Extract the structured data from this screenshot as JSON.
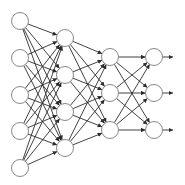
{
  "diagram": {
    "type": "neural-network",
    "title": "",
    "colors": {
      "background": "#ffffff",
      "edge": "#2b2b2b",
      "node_fill": "#ffffff",
      "node_stroke": "#7a7a7a"
    },
    "node_radius": 8.5,
    "layers": [
      {
        "name": "input",
        "x": 20,
        "nodes_y": [
          21,
          58,
          95,
          131,
          168
        ]
      },
      {
        "name": "hidden-1",
        "x": 65,
        "nodes_y": [
          38,
          75,
          112,
          148
        ]
      },
      {
        "name": "hidden-2",
        "x": 110,
        "nodes_y": [
          57,
          93,
          130
        ]
      },
      {
        "name": "output",
        "x": 154,
        "nodes_y": [
          57,
          93,
          130
        ]
      }
    ],
    "connections": "fully-connected",
    "output_arrow_end_x": 173
  }
}
